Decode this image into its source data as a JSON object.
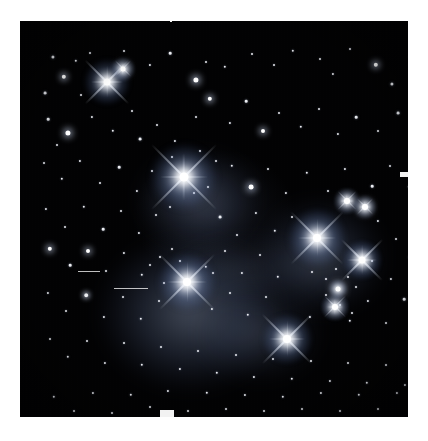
{
  "page": {
    "background_color": "#ffffff",
    "kind": "astronomical-photograph",
    "orientation": "portrait",
    "width_px": 428,
    "height_px": 441
  },
  "photo": {
    "frame": {
      "left": 20,
      "top": 21,
      "width": 388,
      "height": 396
    },
    "sky_color": "#020203",
    "star_color": "#ffffff",
    "nebula_color": "#8aa4d8",
    "border_color": "#ffffff",
    "description": "Dense field of white point-like stars on a near-black sky. Several very bright stars show four-pointed diffraction spikes. Soft blue-grey reflection nebulosity surrounds the bright stars in the lower-left and right-center of the frame."
  },
  "bright_stars": [
    {
      "name": "star-upper-left-bright",
      "x": 87,
      "y": 61,
      "core": 7,
      "halo": 46,
      "spike": 62,
      "tilt": 0
    },
    {
      "name": "star-upper-left-small",
      "x": 103,
      "y": 48,
      "core": 5,
      "halo": 24,
      "spike": 22,
      "tilt": 0
    },
    {
      "name": "star-center-brightest",
      "x": 164,
      "y": 156,
      "core": 9,
      "halo": 66,
      "spike": 92,
      "tilt": 0
    },
    {
      "name": "star-right-upper",
      "x": 297,
      "y": 217,
      "core": 8,
      "halo": 58,
      "spike": 74,
      "tilt": 0
    },
    {
      "name": "star-right-lower",
      "x": 342,
      "y": 239,
      "core": 7,
      "halo": 40,
      "spike": 58,
      "tilt": 0
    },
    {
      "name": "star-right-top-pair-a",
      "x": 327,
      "y": 180,
      "core": 6,
      "halo": 26,
      "spike": 26,
      "tilt": 0
    },
    {
      "name": "star-right-top-pair-b",
      "x": 345,
      "y": 186,
      "core": 6,
      "halo": 24,
      "spike": 22,
      "tilt": 0
    },
    {
      "name": "star-lower-left-bright",
      "x": 167,
      "y": 261,
      "core": 8,
      "halo": 58,
      "spike": 78,
      "tilt": 0
    },
    {
      "name": "star-lower-center",
      "x": 267,
      "y": 318,
      "core": 8,
      "halo": 50,
      "spike": 70,
      "tilt": 0
    },
    {
      "name": "star-lower-right",
      "x": 315,
      "y": 286,
      "core": 6,
      "halo": 28,
      "spike": 30,
      "tilt": 0
    },
    {
      "name": "star-right-mid-small",
      "x": 318,
      "y": 268,
      "core": 5,
      "halo": 20,
      "spike": 18,
      "tilt": 0
    }
  ],
  "nebulae": [
    {
      "name": "nebula-merope-lower-left",
      "x": 170,
      "y": 292,
      "w": 176,
      "h": 150,
      "opacity": 0.38
    },
    {
      "name": "nebula-maia-center",
      "x": 178,
      "y": 178,
      "w": 118,
      "h": 96,
      "opacity": 0.26
    },
    {
      "name": "nebula-alcyone-right",
      "x": 300,
      "y": 236,
      "w": 126,
      "h": 112,
      "opacity": 0.3
    },
    {
      "name": "nebula-merope-south",
      "x": 240,
      "y": 312,
      "w": 122,
      "h": 96,
      "opacity": 0.2
    },
    {
      "name": "nebula-faint-bridge",
      "x": 230,
      "y": 250,
      "w": 150,
      "h": 70,
      "opacity": 0.14
    }
  ],
  "field_stars": [
    {
      "x": 33,
      "y": 36,
      "r": 1.6
    },
    {
      "x": 56,
      "y": 40,
      "r": 1.2
    },
    {
      "x": 70,
      "y": 32,
      "r": 1.0
    },
    {
      "x": 44,
      "y": 56,
      "r": 2.2
    },
    {
      "x": 25,
      "y": 72,
      "r": 1.4
    },
    {
      "x": 61,
      "y": 74,
      "r": 1.0
    },
    {
      "x": 104,
      "y": 30,
      "r": 1.0
    },
    {
      "x": 130,
      "y": 44,
      "r": 1.1
    },
    {
      "x": 150,
      "y": 32,
      "r": 1.3
    },
    {
      "x": 176,
      "y": 59,
      "r": 2.6
    },
    {
      "x": 186,
      "y": 41,
      "r": 1.0
    },
    {
      "x": 205,
      "y": 46,
      "r": 1.2
    },
    {
      "x": 232,
      "y": 33,
      "r": 1.0
    },
    {
      "x": 254,
      "y": 44,
      "r": 1.0
    },
    {
      "x": 273,
      "y": 30,
      "r": 1.2
    },
    {
      "x": 300,
      "y": 38,
      "r": 1.0
    },
    {
      "x": 313,
      "y": 53,
      "r": 1.1
    },
    {
      "x": 330,
      "y": 28,
      "r": 1.0
    },
    {
      "x": 356,
      "y": 44,
      "r": 2.2
    },
    {
      "x": 372,
      "y": 63,
      "r": 1.6
    },
    {
      "x": 390,
      "y": 36,
      "r": 1.1
    },
    {
      "x": 28,
      "y": 98,
      "r": 1.3
    },
    {
      "x": 48,
      "y": 112,
      "r": 2.6
    },
    {
      "x": 37,
      "y": 124,
      "r": 1.0
    },
    {
      "x": 72,
      "y": 96,
      "r": 1.1
    },
    {
      "x": 93,
      "y": 110,
      "r": 1.2
    },
    {
      "x": 112,
      "y": 90,
      "r": 1.0
    },
    {
      "x": 120,
      "y": 118,
      "r": 1.4
    },
    {
      "x": 137,
      "y": 104,
      "r": 1.0
    },
    {
      "x": 155,
      "y": 120,
      "r": 1.1
    },
    {
      "x": 190,
      "y": 78,
      "r": 2.2
    },
    {
      "x": 176,
      "y": 96,
      "r": 1.0
    },
    {
      "x": 210,
      "y": 102,
      "r": 1.1
    },
    {
      "x": 226,
      "y": 80,
      "r": 1.3
    },
    {
      "x": 243,
      "y": 110,
      "r": 2.0
    },
    {
      "x": 259,
      "y": 92,
      "r": 1.0
    },
    {
      "x": 281,
      "y": 106,
      "r": 1.2
    },
    {
      "x": 299,
      "y": 88,
      "r": 1.0
    },
    {
      "x": 318,
      "y": 113,
      "r": 1.1
    },
    {
      "x": 336,
      "y": 96,
      "r": 1.3
    },
    {
      "x": 358,
      "y": 110,
      "r": 1.0
    },
    {
      "x": 378,
      "y": 92,
      "r": 1.4
    },
    {
      "x": 396,
      "y": 118,
      "r": 1.2
    },
    {
      "x": 24,
      "y": 142,
      "r": 1.0
    },
    {
      "x": 42,
      "y": 158,
      "r": 1.2
    },
    {
      "x": 60,
      "y": 140,
      "r": 1.1
    },
    {
      "x": 80,
      "y": 162,
      "r": 1.0
    },
    {
      "x": 99,
      "y": 146,
      "r": 1.3
    },
    {
      "x": 117,
      "y": 170,
      "r": 1.1
    },
    {
      "x": 132,
      "y": 150,
      "r": 1.0
    },
    {
      "x": 212,
      "y": 145,
      "r": 1.2
    },
    {
      "x": 231,
      "y": 166,
      "r": 2.4
    },
    {
      "x": 248,
      "y": 148,
      "r": 1.0
    },
    {
      "x": 266,
      "y": 172,
      "r": 1.1
    },
    {
      "x": 287,
      "y": 152,
      "r": 1.2
    },
    {
      "x": 308,
      "y": 170,
      "r": 1.0
    },
    {
      "x": 325,
      "y": 148,
      "r": 1.1
    },
    {
      "x": 352,
      "y": 165,
      "r": 1.3
    },
    {
      "x": 370,
      "y": 145,
      "r": 1.0
    },
    {
      "x": 389,
      "y": 166,
      "r": 1.2
    },
    {
      "x": 26,
      "y": 188,
      "r": 1.1
    },
    {
      "x": 45,
      "y": 206,
      "r": 1.0
    },
    {
      "x": 64,
      "y": 186,
      "r": 1.2
    },
    {
      "x": 83,
      "y": 208,
      "r": 1.3
    },
    {
      "x": 101,
      "y": 190,
      "r": 1.0
    },
    {
      "x": 119,
      "y": 212,
      "r": 1.1
    },
    {
      "x": 136,
      "y": 194,
      "r": 1.0
    },
    {
      "x": 200,
      "y": 196,
      "r": 1.4
    },
    {
      "x": 217,
      "y": 214,
      "r": 1.0
    },
    {
      "x": 236,
      "y": 192,
      "r": 1.1
    },
    {
      "x": 255,
      "y": 210,
      "r": 1.2
    },
    {
      "x": 272,
      "y": 196,
      "r": 1.0
    },
    {
      "x": 358,
      "y": 200,
      "r": 1.1
    },
    {
      "x": 376,
      "y": 218,
      "r": 1.0
    },
    {
      "x": 394,
      "y": 196,
      "r": 1.2
    },
    {
      "x": 30,
      "y": 228,
      "r": 2.2
    },
    {
      "x": 50,
      "y": 244,
      "r": 1.3
    },
    {
      "x": 68,
      "y": 230,
      "r": 2.0
    },
    {
      "x": 86,
      "y": 250,
      "r": 1.0
    },
    {
      "x": 104,
      "y": 232,
      "r": 1.1
    },
    {
      "x": 122,
      "y": 254,
      "r": 1.2
    },
    {
      "x": 140,
      "y": 236,
      "r": 1.0
    },
    {
      "x": 186,
      "y": 246,
      "r": 1.2
    },
    {
      "x": 205,
      "y": 230,
      "r": 1.0
    },
    {
      "x": 222,
      "y": 252,
      "r": 1.1
    },
    {
      "x": 240,
      "y": 234,
      "r": 1.0
    },
    {
      "x": 258,
      "y": 256,
      "r": 1.2
    },
    {
      "x": 352,
      "y": 240,
      "r": 1.0
    },
    {
      "x": 371,
      "y": 258,
      "r": 1.1
    },
    {
      "x": 390,
      "y": 236,
      "r": 1.3
    },
    {
      "x": 28,
      "y": 272,
      "r": 1.1
    },
    {
      "x": 46,
      "y": 290,
      "r": 1.0
    },
    {
      "x": 66,
      "y": 274,
      "r": 1.8
    },
    {
      "x": 84,
      "y": 296,
      "r": 1.1
    },
    {
      "x": 103,
      "y": 276,
      "r": 1.0
    },
    {
      "x": 121,
      "y": 298,
      "r": 1.2
    },
    {
      "x": 139,
      "y": 280,
      "r": 1.0
    },
    {
      "x": 192,
      "y": 288,
      "r": 1.1
    },
    {
      "x": 210,
      "y": 272,
      "r": 1.0
    },
    {
      "x": 228,
      "y": 294,
      "r": 1.2
    },
    {
      "x": 246,
      "y": 276,
      "r": 1.0
    },
    {
      "x": 290,
      "y": 296,
      "r": 1.1
    },
    {
      "x": 306,
      "y": 274,
      "r": 1.0
    },
    {
      "x": 330,
      "y": 300,
      "r": 1.2
    },
    {
      "x": 348,
      "y": 280,
      "r": 1.1
    },
    {
      "x": 366,
      "y": 302,
      "r": 1.0
    },
    {
      "x": 384,
      "y": 278,
      "r": 1.3
    },
    {
      "x": 30,
      "y": 318,
      "r": 1.0
    },
    {
      "x": 48,
      "y": 336,
      "r": 1.2
    },
    {
      "x": 67,
      "y": 320,
      "r": 1.0
    },
    {
      "x": 85,
      "y": 342,
      "r": 1.1
    },
    {
      "x": 104,
      "y": 322,
      "r": 1.0
    },
    {
      "x": 122,
      "y": 344,
      "r": 1.2
    },
    {
      "x": 141,
      "y": 326,
      "r": 1.0
    },
    {
      "x": 160,
      "y": 348,
      "r": 1.1
    },
    {
      "x": 178,
      "y": 330,
      "r": 1.0
    },
    {
      "x": 197,
      "y": 352,
      "r": 1.2
    },
    {
      "x": 216,
      "y": 334,
      "r": 1.0
    },
    {
      "x": 234,
      "y": 356,
      "r": 1.1
    },
    {
      "x": 253,
      "y": 338,
      "r": 1.0
    },
    {
      "x": 272,
      "y": 358,
      "r": 1.2
    },
    {
      "x": 291,
      "y": 340,
      "r": 1.0
    },
    {
      "x": 310,
      "y": 360,
      "r": 1.1
    },
    {
      "x": 328,
      "y": 342,
      "r": 1.0
    },
    {
      "x": 347,
      "y": 362,
      "r": 1.2
    },
    {
      "x": 366,
      "y": 344,
      "r": 1.0
    },
    {
      "x": 385,
      "y": 364,
      "r": 1.1
    },
    {
      "x": 34,
      "y": 376,
      "r": 1.2
    },
    {
      "x": 54,
      "y": 390,
      "r": 1.0
    },
    {
      "x": 73,
      "y": 372,
      "r": 1.1
    },
    {
      "x": 92,
      "y": 392,
      "r": 1.0
    },
    {
      "x": 111,
      "y": 374,
      "r": 1.2
    },
    {
      "x": 130,
      "y": 386,
      "r": 1.0
    },
    {
      "x": 148,
      "y": 370,
      "r": 1.1
    },
    {
      "x": 168,
      "y": 390,
      "r": 1.0
    },
    {
      "x": 187,
      "y": 372,
      "r": 1.2
    },
    {
      "x": 206,
      "y": 388,
      "r": 1.0
    },
    {
      "x": 225,
      "y": 374,
      "r": 1.1
    },
    {
      "x": 244,
      "y": 390,
      "r": 1.0
    },
    {
      "x": 263,
      "y": 376,
      "r": 1.2
    },
    {
      "x": 282,
      "y": 388,
      "r": 1.0
    },
    {
      "x": 301,
      "y": 372,
      "r": 1.1
    },
    {
      "x": 320,
      "y": 390,
      "r": 1.0
    },
    {
      "x": 339,
      "y": 374,
      "r": 1.2
    },
    {
      "x": 358,
      "y": 388,
      "r": 1.0
    },
    {
      "x": 377,
      "y": 372,
      "r": 1.1
    },
    {
      "x": 396,
      "y": 386,
      "r": 1.0
    },
    {
      "x": 292,
      "y": 251,
      "r": 1.0
    },
    {
      "x": 306,
      "y": 258,
      "r": 1.0
    },
    {
      "x": 316,
      "y": 248,
      "r": 1.0
    },
    {
      "x": 328,
      "y": 256,
      "r": 1.0
    },
    {
      "x": 336,
      "y": 266,
      "r": 1.0
    },
    {
      "x": 320,
      "y": 284,
      "r": 1.0
    },
    {
      "x": 332,
      "y": 292,
      "r": 1.0
    },
    {
      "x": 152,
      "y": 228,
      "r": 1.0
    },
    {
      "x": 160,
      "y": 240,
      "r": 1.0
    },
    {
      "x": 130,
      "y": 244,
      "r": 1.0
    },
    {
      "x": 144,
      "y": 262,
      "r": 1.0
    },
    {
      "x": 193,
      "y": 252,
      "r": 1.0
    },
    {
      "x": 180,
      "y": 130,
      "r": 1.0
    },
    {
      "x": 196,
      "y": 140,
      "r": 1.0
    },
    {
      "x": 152,
      "y": 136,
      "r": 1.0
    },
    {
      "x": 174,
      "y": 172,
      "r": 1.0
    },
    {
      "x": 188,
      "y": 166,
      "r": 1.0
    },
    {
      "x": 150,
      "y": 186,
      "r": 1.0
    }
  ],
  "artifacts": [
    {
      "name": "scratch-left-upper",
      "x": 58,
      "y": 250,
      "w": 22,
      "h": 1
    },
    {
      "name": "scratch-left-lower",
      "x": 94,
      "y": 267,
      "w": 34,
      "h": 1
    },
    {
      "name": "edge-nick-top",
      "x": 170,
      "y": 0,
      "w": 2,
      "h": 22
    },
    {
      "name": "edge-nick-bottom",
      "x": 160,
      "y": 410,
      "w": 14,
      "h": 9
    },
    {
      "name": "edge-nick-right",
      "x": 400,
      "y": 172,
      "w": 9,
      "h": 5
    }
  ]
}
